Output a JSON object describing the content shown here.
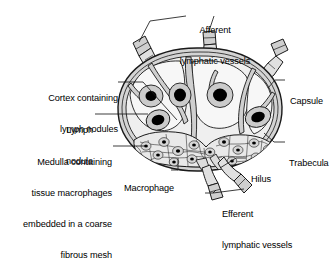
{
  "figure": {
    "type": "anatomical-diagram",
    "palette": {
      "outline": "#1a1a1a",
      "capsule_fill": "#d8d8d8",
      "cortex_fill": "#f2f2f2",
      "nodule_fill": "#c9c9c9",
      "nodule_core": "#000000",
      "medulla_fill": "#e8e8e8",
      "vessel_fill": "#cfcfcf",
      "background": "#ffffff",
      "leader_line": "#1a1a1a"
    }
  },
  "labels": {
    "afferent": {
      "line1": "Afferent",
      "line2": "lymphatic vessels"
    },
    "cortex": {
      "line1": "Cortex containing",
      "line2": "lymph nodules"
    },
    "lymph_nodule": {
      "line1": "Lymph",
      "line2": "nodule"
    },
    "medulla": {
      "line1": "Medulla containing",
      "line2": "tissue macrophages",
      "line3": "embedded in a coarse",
      "line4": "fibrous mesh"
    },
    "macrophage": {
      "line1": "Macrophage"
    },
    "capsule": {
      "line1": "Capsule"
    },
    "trabecula": {
      "line1": "Trabecula"
    },
    "hilus": {
      "line1": "Hilus"
    },
    "efferent": {
      "line1": "Efferent",
      "line2": "lymphatic vessels"
    }
  }
}
